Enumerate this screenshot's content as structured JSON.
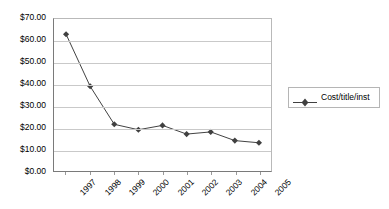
{
  "chart_data": {
    "type": "line",
    "title": "",
    "xlabel": "",
    "ylabel": "",
    "categories": [
      "1997",
      "1998",
      "1999",
      "2000",
      "2001",
      "2002",
      "2003",
      "2004",
      "2005"
    ],
    "series": [
      {
        "name": "Cost/title/inst",
        "values": [
          63.0,
          39.0,
          21.5,
          19.0,
          21.0,
          17.0,
          18.0,
          14.0,
          13.0
        ],
        "color": "#404040",
        "marker": "diamond"
      }
    ],
    "ylim": [
      0,
      70
    ],
    "ytick_values": [
      0,
      10,
      20,
      30,
      40,
      50,
      60,
      70
    ],
    "ytick_labels": [
      "$0.00",
      "$10.00",
      "$20.00",
      "$30.00",
      "$40.00",
      "$50.00",
      "$60.00",
      "$70.00"
    ],
    "grid": true,
    "grid_axis": "y",
    "legend_position": "right",
    "legend_entries": [
      "Cost/title/inst"
    ],
    "xtick_rotation": -45
  },
  "legend": {
    "label": "Cost/title/inst"
  },
  "colors": {
    "series": "#404040",
    "gridline": "#c9c9c9",
    "axis": "#7a7a7a",
    "plot_background": "#ffffff",
    "text": "#000000"
  }
}
